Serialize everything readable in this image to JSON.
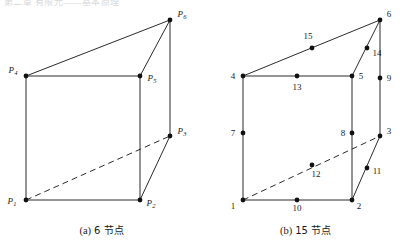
{
  "top_strip": {
    "text": "第二章  有限元——基本原理"
  },
  "figure": {
    "kind": "diagram",
    "panels": [
      {
        "id": "panel-a",
        "caption_tag": "(a)",
        "caption_text": "6 节点",
        "node_label_style": "italic-P-subscript",
        "nodes": [
          {
            "id": "P1",
            "label_main": "P",
            "label_sub": "1",
            "x": 26,
            "y": 200,
            "label_x": 12,
            "label_y": 204,
            "label_anchor": "middle"
          },
          {
            "id": "P2",
            "label_main": "P",
            "label_sub": "2",
            "x": 140,
            "y": 200,
            "label_x": 151,
            "label_y": 206,
            "label_anchor": "middle"
          },
          {
            "id": "P3",
            "label_main": "P",
            "label_sub": "3",
            "x": 170,
            "y": 136,
            "label_x": 182,
            "label_y": 134,
            "label_anchor": "middle"
          },
          {
            "id": "P4",
            "label_main": "P",
            "label_sub": "4",
            "x": 26,
            "y": 76,
            "label_x": 13,
            "label_y": 73,
            "label_anchor": "middle"
          },
          {
            "id": "P5",
            "label_main": "P",
            "label_sub": "5",
            "x": 140,
            "y": 76,
            "label_x": 152,
            "label_y": 81,
            "label_anchor": "middle"
          },
          {
            "id": "P6",
            "label_main": "P",
            "label_sub": "6",
            "x": 170,
            "y": 20,
            "label_x": 182,
            "label_y": 17,
            "label_anchor": "middle"
          }
        ],
        "edges_solid": [
          {
            "from": "P1",
            "to": "P2"
          },
          {
            "from": "P2",
            "to": "P3"
          },
          {
            "from": "P1",
            "to": "P4"
          },
          {
            "from": "P2",
            "to": "P5"
          },
          {
            "from": "P3",
            "to": "P6"
          },
          {
            "from": "P4",
            "to": "P5"
          },
          {
            "from": "P5",
            "to": "P6"
          },
          {
            "from": "P4",
            "to": "P6"
          }
        ],
        "edges_dashed": [
          {
            "from": "P1",
            "to": "P3"
          }
        ]
      },
      {
        "id": "panel-b",
        "caption_tag": "(b)",
        "caption_text": "15 节点",
        "node_label_style": "plain-number",
        "nodes": [
          {
            "id": "1",
            "label_main": "1",
            "label_sub": "",
            "x": 39,
            "y": 200,
            "label_x": 29,
            "label_y": 209,
            "label_anchor": "middle"
          },
          {
            "id": "2",
            "label_main": "2",
            "label_sub": "",
            "x": 148,
            "y": 200,
            "label_x": 155,
            "label_y": 209,
            "label_anchor": "middle"
          },
          {
            "id": "3",
            "label_main": "3",
            "label_sub": "",
            "x": 176,
            "y": 136,
            "label_x": 185,
            "label_y": 134,
            "label_anchor": "middle"
          },
          {
            "id": "4",
            "label_main": "4",
            "label_sub": "",
            "x": 39,
            "y": 76,
            "label_x": 29,
            "label_y": 79,
            "label_anchor": "middle"
          },
          {
            "id": "5",
            "label_main": "5",
            "label_sub": "",
            "x": 148,
            "y": 76,
            "label_x": 157,
            "label_y": 79,
            "label_anchor": "middle"
          },
          {
            "id": "6",
            "label_main": "6",
            "label_sub": "",
            "x": 176,
            "y": 20,
            "label_x": 185,
            "label_y": 17,
            "label_anchor": "middle"
          },
          {
            "id": "7",
            "label_main": "7",
            "label_sub": "",
            "x": 39,
            "y": 133,
            "label_x": 29,
            "label_y": 136,
            "label_anchor": "middle"
          },
          {
            "id": "8",
            "label_main": "8",
            "label_sub": "",
            "x": 148,
            "y": 133,
            "label_x": 139,
            "label_y": 136,
            "label_anchor": "middle"
          },
          {
            "id": "9",
            "label_main": "9",
            "label_sub": "",
            "x": 176,
            "y": 78,
            "label_x": 185,
            "label_y": 81,
            "label_anchor": "middle"
          },
          {
            "id": "10",
            "label_main": "10",
            "label_sub": "",
            "x": 93,
            "y": 200,
            "label_x": 93,
            "label_y": 211,
            "label_anchor": "middle"
          },
          {
            "id": "11",
            "label_main": "11",
            "label_sub": "",
            "x": 163,
            "y": 168,
            "label_x": 173,
            "label_y": 174,
            "label_anchor": "middle"
          },
          {
            "id": "12",
            "label_main": "12",
            "label_sub": "",
            "x": 108,
            "y": 165,
            "label_x": 112,
            "label_y": 177,
            "label_anchor": "middle"
          },
          {
            "id": "13",
            "label_main": "13",
            "label_sub": "",
            "x": 93,
            "y": 76,
            "label_x": 93,
            "label_y": 90,
            "label_anchor": "middle"
          },
          {
            "id": "14",
            "label_main": "14",
            "label_sub": "",
            "x": 163,
            "y": 48,
            "label_x": 173,
            "label_y": 56,
            "label_anchor": "middle"
          },
          {
            "id": "15",
            "label_main": "15",
            "label_sub": "",
            "x": 108,
            "y": 48,
            "label_x": 104,
            "label_y": 39,
            "label_anchor": "middle"
          }
        ],
        "edges_solid": [
          {
            "from": "1",
            "to": "2"
          },
          {
            "from": "2",
            "to": "3"
          },
          {
            "from": "1",
            "to": "4"
          },
          {
            "from": "2",
            "to": "5"
          },
          {
            "from": "3",
            "to": "6"
          },
          {
            "from": "4",
            "to": "5"
          },
          {
            "from": "5",
            "to": "6"
          },
          {
            "from": "4",
            "to": "6"
          }
        ],
        "edges_dashed": [
          {
            "from": "1",
            "to": "3"
          }
        ]
      }
    ]
  }
}
